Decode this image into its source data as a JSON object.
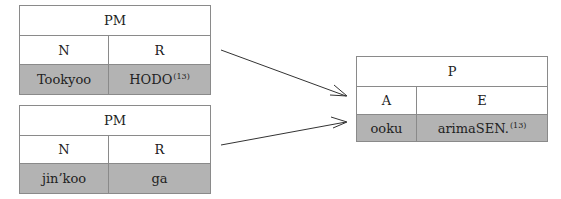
{
  "diagram": {
    "tables": [
      {
        "id": "pm-1",
        "title": "PM",
        "columns": [
          "N",
          "R"
        ],
        "values": [
          "Tookyoo",
          "HODO"
        ],
        "value_superscripts": [
          "",
          "(13)"
        ]
      },
      {
        "id": "pm-2",
        "title": "PM",
        "columns": [
          "N",
          "R"
        ],
        "values": [
          "jin’koo",
          "ga"
        ],
        "value_superscripts": [
          "",
          ""
        ]
      },
      {
        "id": "p",
        "title": "P",
        "columns": [
          "A",
          "E"
        ],
        "values": [
          "ooku",
          "arimaSEN."
        ],
        "value_superscripts": [
          "",
          "(13)"
        ]
      }
    ],
    "arrows": [
      {
        "from": "pm-1",
        "to": "p"
      },
      {
        "from": "pm-2",
        "to": "p"
      }
    ],
    "colors": {
      "border": "#8a8a8a",
      "shaded_row": "#b3b3b3",
      "arrow": "#333333"
    }
  }
}
